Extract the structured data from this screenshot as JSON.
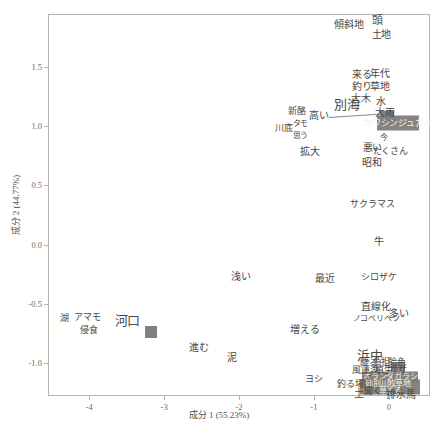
{
  "chart_data": {
    "type": "scatter",
    "title": "",
    "xlabel": "成分 1 (55.23%)",
    "ylabel": "成分 2 (44.77%)",
    "xlim": [
      -4.55,
      0.55
    ],
    "ylim": [
      -1.28,
      1.95
    ],
    "xticks": [
      "-4",
      "-3",
      "-2",
      "-1",
      "0"
    ],
    "xtickvalues": [
      -4,
      -3,
      -2,
      -1,
      0
    ],
    "yticks": [
      "1.5",
      "1.0",
      "0.5",
      "0.0",
      "-0.5",
      "-1.0"
    ],
    "ytickvalues": [
      1.5,
      1.0,
      0.5,
      0.0,
      -0.5,
      -1.0
    ],
    "grid": false,
    "legend": null,
    "marker_color": "#808080",
    "frame_color": "#b8b4ad",
    "text_color": "#4a4742",
    "points": [
      {
        "label": "河口",
        "x": -3.17,
        "y": -0.74,
        "marker": true,
        "size": 12
      },
      {
        "label": "別海",
        "x": -0.02,
        "y": 1.07,
        "marker": true,
        "size": 14
      },
      {
        "label": "浜中",
        "x": 0.12,
        "y": -1.05,
        "marker": true,
        "size": 14
      }
    ],
    "labels": [
      {
        "text": "傾斜地",
        "x": -0.53,
        "y": 1.86,
        "size": 10
      },
      {
        "text": "頭",
        "x": -0.15,
        "y": 1.9,
        "size": 11
      },
      {
        "text": "土地",
        "x": -0.1,
        "y": 1.77,
        "size": 10
      },
      {
        "text": "来る",
        "x": -0.36,
        "y": 1.43,
        "size": 10
      },
      {
        "text": "年代",
        "x": -0.12,
        "y": 1.44,
        "size": 10
      },
      {
        "text": "釣り",
        "x": -0.36,
        "y": 1.33,
        "size": 10
      },
      {
        "text": "草地",
        "x": -0.12,
        "y": 1.33,
        "size": 10
      },
      {
        "text": "大木",
        "x": -0.37,
        "y": 1.23,
        "size": 10
      },
      {
        "text": "水",
        "x": -0.11,
        "y": 1.21,
        "size": 10
      },
      {
        "text": "大雨",
        "x": -0.05,
        "y": 1.11,
        "size": 10
      },
      {
        "text": "新酪",
        "x": -1.23,
        "y": 1.13,
        "size": 9
      },
      {
        "text": "高い",
        "x": -0.93,
        "y": 1.09,
        "size": 10
      },
      {
        "text": "カワシンジュガイ",
        "x": 0.12,
        "y": 1.03,
        "size": 9
      },
      {
        "text": "川底",
        "x": -1.4,
        "y": 0.99,
        "size": 9
      },
      {
        "text": "タモ",
        "x": -1.18,
        "y": 1.02,
        "size": 8
      },
      {
        "text": "思う",
        "x": -1.18,
        "y": 0.92,
        "size": 8
      },
      {
        "text": "今",
        "x": -0.07,
        "y": 0.9,
        "size": 8
      },
      {
        "text": "悪い",
        "x": -0.22,
        "y": 0.82,
        "size": 10
      },
      {
        "text": "たくさん",
        "x": 0.02,
        "y": 0.79,
        "size": 9
      },
      {
        "text": "拡大",
        "x": -1.05,
        "y": 0.78,
        "size": 10
      },
      {
        "text": "昭和",
        "x": -0.23,
        "y": 0.69,
        "size": 10
      },
      {
        "text": "サクラマス",
        "x": -0.22,
        "y": 0.34,
        "size": 9
      },
      {
        "text": "牛",
        "x": -0.13,
        "y": 0.02,
        "size": 10
      },
      {
        "text": "浅い",
        "x": -1.97,
        "y": -0.27,
        "size": 10
      },
      {
        "text": "最近",
        "x": -0.85,
        "y": -0.29,
        "size": 10
      },
      {
        "text": "シロザケ",
        "x": -0.13,
        "y": -0.27,
        "size": 9
      },
      {
        "text": "直線化",
        "x": -0.17,
        "y": -0.53,
        "size": 10
      },
      {
        "text": "ノコベリベツ",
        "x": -0.17,
        "y": -0.63,
        "size": 8
      },
      {
        "text": "多い",
        "x": 0.14,
        "y": -0.59,
        "size": 10
      },
      {
        "text": "湖",
        "x": -4.33,
        "y": -0.62,
        "size": 9
      },
      {
        "text": "アマモ",
        "x": -4.02,
        "y": -0.61,
        "size": 9
      },
      {
        "text": "侵食",
        "x": -4.0,
        "y": -0.72,
        "size": 9
      },
      {
        "text": "増える",
        "x": -1.12,
        "y": -0.72,
        "size": 10
      },
      {
        "text": "進む",
        "x": -2.54,
        "y": -0.87,
        "size": 10
      },
      {
        "text": "泥",
        "x": -2.1,
        "y": -0.96,
        "size": 10
      },
      {
        "text": "降る",
        "x": -0.27,
        "y": -1.0,
        "size": 9
      },
      {
        "text": "負担",
        "x": -0.1,
        "y": -0.99,
        "size": 9
      },
      {
        "text": "飴色",
        "x": 0.11,
        "y": -0.99,
        "size": 9
      },
      {
        "text": "風蓮湖",
        "x": -0.31,
        "y": -1.06,
        "size": 9
      },
      {
        "text": "植生",
        "x": -0.06,
        "y": -1.06,
        "size": 9
      },
      {
        "text": "ササ",
        "x": 0.12,
        "y": -1.06,
        "size": 9
      },
      {
        "text": "上",
        "x": -0.29,
        "y": -1.12,
        "size": 9
      },
      {
        "text": "オランダガラシ",
        "x": 0.02,
        "y": -1.12,
        "size": 8
      },
      {
        "text": "ヨシ",
        "x": -1.0,
        "y": -1.14,
        "size": 9
      },
      {
        "text": "釣る場所",
        "x": -0.45,
        "y": -1.18,
        "size": 9
      },
      {
        "text": "姉別川",
        "x": -0.16,
        "y": -1.18,
        "size": 8
      },
      {
        "text": "牧草地",
        "x": 0.14,
        "y": -1.18,
        "size": 8
      },
      {
        "text": "聞く",
        "x": -0.21,
        "y": -1.24,
        "size": 9
      },
      {
        "text": "草とる",
        "x": 0.02,
        "y": -1.24,
        "size": 8
      },
      {
        "text": "土",
        "x": -0.4,
        "y": -1.26,
        "size": 10
      },
      {
        "text": "排水",
        "x": 0.09,
        "y": -1.27,
        "size": 10
      },
      {
        "text": "馬",
        "x": 0.29,
        "y": -1.27,
        "size": 10
      }
    ]
  },
  "axis": {
    "x_title": "成分 1 (55.23%)",
    "y_title": "成分 2 (44.77%)",
    "xtick_0": "-4",
    "xtick_1": "-3",
    "xtick_2": "-2",
    "xtick_3": "-1",
    "xtick_4": "0",
    "ytick_0": "1.5",
    "ytick_1": "1.0",
    "ytick_2": "0.5",
    "ytick_3": "0.0",
    "ytick_4": "-0.5",
    "ytick_5": "-1.0"
  }
}
